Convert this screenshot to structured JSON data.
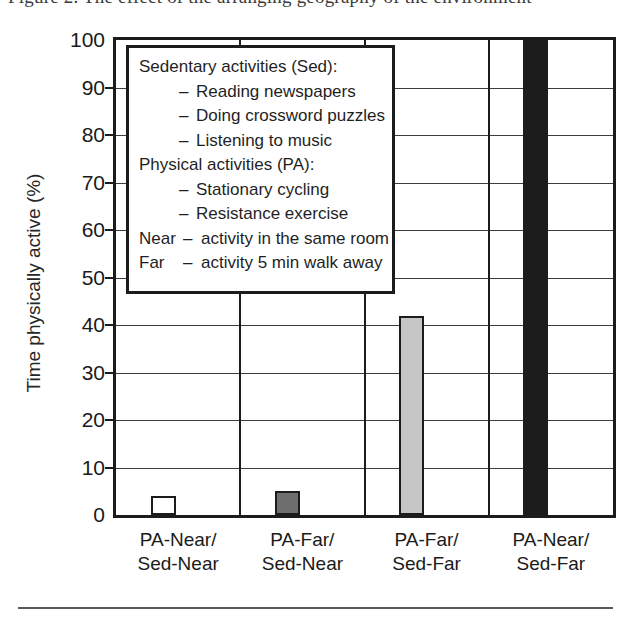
{
  "caption": {
    "text": "Figure  2.  The  effect  of  the  arranging  geography  of  the  environment"
  },
  "chart_data": {
    "type": "bar",
    "title": "",
    "xlabel": "",
    "ylabel": "Time physically active (%)",
    "ylim": [
      0,
      100
    ],
    "ytick_step": 10,
    "grid": true,
    "legend_position": "inside-top-left",
    "categories": [
      "PA-Near/\nSed-Near",
      "PA-Far/\nSed-Near",
      "PA-Far/\nSed-Far",
      "PA-Near/\nSed-Far"
    ],
    "values": [
      4,
      5,
      42,
      100
    ],
    "bar_colors": [
      "#ffffff",
      "#6e6e6e",
      "#c6c6c6",
      "#1c1c1c"
    ],
    "yticks": [
      0,
      10,
      20,
      30,
      40,
      50,
      60,
      70,
      80,
      90,
      100
    ]
  },
  "axes": {
    "y_title": "Time physically active (%)",
    "y_labels": [
      "100",
      "90",
      "80",
      "70",
      "60",
      "50",
      "40",
      "30",
      "20",
      "10",
      "0"
    ],
    "x_categories": [
      {
        "line1": "PA-Near/",
        "line2": "Sed-Near"
      },
      {
        "line1": "PA-Far/",
        "line2": "Sed-Near"
      },
      {
        "line1": "PA-Far/",
        "line2": "Sed-Far"
      },
      {
        "line1": "PA-Near/",
        "line2": "Sed-Far"
      }
    ]
  },
  "legend": {
    "sedentary_heading": "Sedentary activities (Sed):",
    "sedentary_items": [
      "Reading newspapers",
      "Doing crossword puzzles",
      "Listening to music"
    ],
    "physical_heading": "Physical activities (PA):",
    "physical_items": [
      "Stationary cycling",
      "Resistance exercise"
    ],
    "dash": "–",
    "definitions": [
      {
        "term": "Near",
        "dash": "–",
        "text": "activity in the same room"
      },
      {
        "term": "Far",
        "dash": "–",
        "text": "activity 5 min walk away"
      }
    ]
  },
  "colors": {
    "axis": "#1c1c1c",
    "grid": "#3d3d3d",
    "bar_white": "#ffffff",
    "bar_dark_gray": "#6e6e6e",
    "bar_light_gray": "#c6c6c6",
    "bar_black": "#1c1c1c"
  }
}
